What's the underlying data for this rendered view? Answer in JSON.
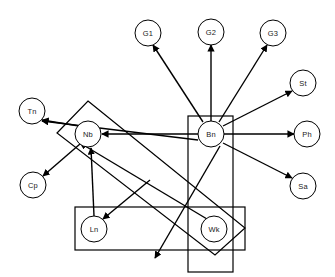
{
  "diagram": {
    "background_color": "#ffffff",
    "stroke_color": "#000000",
    "node_fill_color": "#ffffff",
    "node_radius": 13,
    "nodes": [
      {
        "id": "G1",
        "label": "G1",
        "cx": 148,
        "cy": 33
      },
      {
        "id": "G2",
        "label": "G2",
        "cx": 211,
        "cy": 32
      },
      {
        "id": "G3",
        "label": "G3",
        "cx": 273,
        "cy": 33
      },
      {
        "id": "St",
        "label": "St",
        "cx": 303,
        "cy": 83
      },
      {
        "id": "Tn",
        "label": "Tn",
        "cx": 32,
        "cy": 111
      },
      {
        "id": "Nb",
        "label": "Nb",
        "cx": 88,
        "cy": 134
      },
      {
        "id": "Bn",
        "label": "Bn",
        "cx": 211,
        "cy": 134
      },
      {
        "id": "Ph",
        "label": "Ph",
        "cx": 307,
        "cy": 134
      },
      {
        "id": "Sa",
        "label": "Sa",
        "cx": 303,
        "cy": 186
      },
      {
        "id": "Cp",
        "label": "Cp",
        "cx": 33,
        "cy": 185
      },
      {
        "id": "Ln",
        "label": "Ln",
        "cx": 94,
        "cy": 229
      },
      {
        "id": "Wk",
        "label": "Wk",
        "cx": 214,
        "cy": 229
      }
    ],
    "group_boxes": [
      {
        "name": "nb-diagonal-group",
        "kind": "rotated-rect",
        "points": "88,101 245,228 215,255 57,133"
      },
      {
        "name": "bn-vertical-group",
        "kind": "rect",
        "x": 188,
        "y": 116,
        "width": 45,
        "height": 156
      },
      {
        "name": "ln-wk-horizontal-group",
        "kind": "rect",
        "x": 75,
        "y": 207,
        "width": 170,
        "height": 43
      }
    ],
    "edges": [
      {
        "name": "bn-to-g1",
        "from": "Bn",
        "to": "G1",
        "x1": 203,
        "y1": 122,
        "x2": 153,
        "y2": 45
      },
      {
        "name": "bn-to-g2",
        "from": "Bn",
        "to": "G2",
        "x1": 211,
        "y1": 121,
        "x2": 211,
        "y2": 45
      },
      {
        "name": "bn-to-g3",
        "from": "Bn",
        "to": "G3",
        "x1": 219,
        "y1": 122,
        "x2": 267,
        "y2": 45
      },
      {
        "name": "bn-to-st",
        "from": "Bn",
        "to": "St",
        "x1": 223,
        "y1": 126,
        "x2": 292,
        "y2": 91
      },
      {
        "name": "bn-to-ph",
        "from": "Bn",
        "to": "Ph",
        "x1": 224,
        "y1": 134,
        "x2": 294,
        "y2": 134
      },
      {
        "name": "bn-to-sa",
        "from": "Bn",
        "to": "Sa",
        "x1": 223,
        "y1": 143,
        "x2": 292,
        "y2": 178
      },
      {
        "name": "bn-to-nb",
        "from": "Bn",
        "to": "Nb",
        "x1": 198,
        "y1": 134,
        "x2": 102,
        "y2": 134
      },
      {
        "name": "nb-to-tn",
        "from": "Nb",
        "to": "Tn",
        "x1": 79,
        "y1": 126,
        "x2": 42,
        "y2": 120
      },
      {
        "name": "nb-to-cp",
        "from": "Nb",
        "to": "Cp",
        "x1": 80,
        "y1": 144,
        "x2": 43,
        "y2": 176
      },
      {
        "name": "ln-to-nb",
        "from": "Ln",
        "to": "Nb",
        "x1": 94,
        "y1": 216,
        "x2": 91,
        "y2": 148
      },
      {
        "name": "wk-to-ln",
        "from": "Wk",
        "to": "Ln",
        "x1": 150,
        "y1": 180,
        "x2": 103,
        "y2": 219
      },
      {
        "name": "bn-to-tn-long",
        "from": "Bn",
        "to": "Tn",
        "x1": 198,
        "y1": 140,
        "x2": 42,
        "y2": 121
      },
      {
        "name": "wk-to-nb-long",
        "from": "Wk",
        "to": "Nb",
        "x1": 207,
        "y1": 219,
        "x2": 80,
        "y2": 143
      },
      {
        "name": "bn-down-diagonal",
        "from": "Bn",
        "to": "Wk",
        "x1": 220,
        "y1": 146,
        "x2": 155,
        "y2": 258
      }
    ],
    "legend_note": ""
  }
}
